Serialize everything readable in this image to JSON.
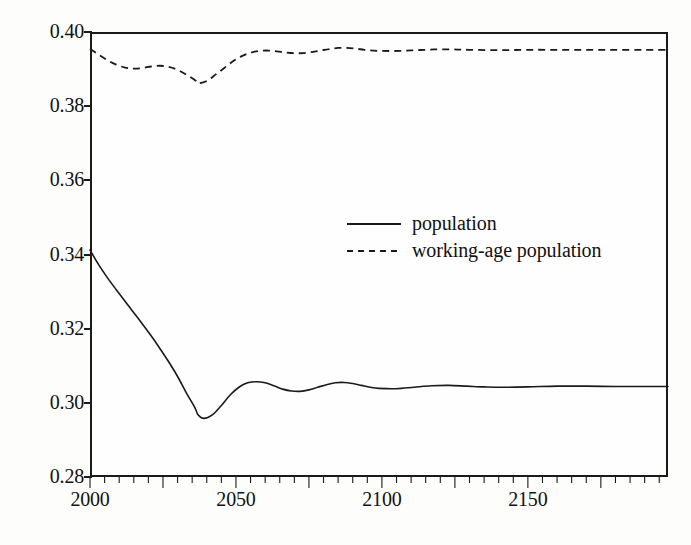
{
  "chart_data": {
    "type": "line",
    "title": "",
    "xlabel": "",
    "ylabel": "",
    "xlim": [
      2000,
      2198
    ],
    "ylim": [
      0.28,
      0.4
    ],
    "grid": false,
    "legend_position": "center",
    "x_ticks": [
      "2000",
      "2050",
      "2100",
      "2150"
    ],
    "x_tick_values": [
      2000,
      2050,
      2100,
      2150
    ],
    "y_ticks": [
      "0.28",
      "0.30",
      "0.32",
      "0.34",
      "0.36",
      "0.38",
      "0.40"
    ],
    "y_tick_values": [
      0.28,
      0.3,
      0.32,
      0.34,
      0.36,
      0.38,
      0.4
    ],
    "x_minor_tick_interval": 5,
    "series": [
      {
        "name": "population",
        "style": "solid",
        "color": "#1a1a1a",
        "x": [
          2000,
          2003,
          2006,
          2009,
          2012,
          2015,
          2018,
          2021,
          2024,
          2027,
          2030,
          2033,
          2036,
          2037,
          2039,
          2042,
          2045,
          2048,
          2051,
          2054,
          2057,
          2060,
          2063,
          2066,
          2069,
          2072,
          2075,
          2078,
          2081,
          2084,
          2087,
          2090,
          2093,
          2096,
          2099,
          2105,
          2111,
          2117,
          2123,
          2129,
          2135,
          2141,
          2150,
          2160,
          2170,
          2180,
          2190,
          2198
        ],
        "y": [
          0.3412,
          0.3372,
          0.3337,
          0.3305,
          0.3274,
          0.3243,
          0.3212,
          0.318,
          0.3146,
          0.311,
          0.3071,
          0.3027,
          0.2986,
          0.2968,
          0.2958,
          0.2968,
          0.2993,
          0.3021,
          0.3042,
          0.3054,
          0.3057,
          0.3054,
          0.3046,
          0.3037,
          0.3032,
          0.3031,
          0.3035,
          0.3042,
          0.3049,
          0.3054,
          0.3055,
          0.3052,
          0.3047,
          0.3042,
          0.3039,
          0.3038,
          0.3042,
          0.3046,
          0.3047,
          0.3045,
          0.3043,
          0.3042,
          0.3043,
          0.3045,
          0.3045,
          0.3044,
          0.3044,
          0.3044
        ]
      },
      {
        "name": "working-age population",
        "style": "dashed",
        "color": "#1a1a1a",
        "x": [
          2000,
          2003,
          2006,
          2009,
          2012,
          2015,
          2018,
          2021,
          2024,
          2027,
          2030,
          2033,
          2036,
          2037,
          2040,
          2043,
          2046,
          2049,
          2052,
          2055,
          2058,
          2061,
          2064,
          2067,
          2070,
          2073,
          2076,
          2079,
          2082,
          2085,
          2088,
          2091,
          2094,
          2097,
          2100,
          2106,
          2112,
          2118,
          2124,
          2130,
          2140,
          2150,
          2160,
          2170,
          2180,
          2190,
          2198
        ],
        "y": [
          0.3955,
          0.3939,
          0.3924,
          0.3912,
          0.3904,
          0.3901,
          0.3903,
          0.3907,
          0.3909,
          0.3906,
          0.3898,
          0.3885,
          0.387,
          0.3862,
          0.3868,
          0.3885,
          0.3903,
          0.3921,
          0.3935,
          0.3944,
          0.3949,
          0.395,
          0.3948,
          0.3945,
          0.3943,
          0.3943,
          0.3946,
          0.395,
          0.3954,
          0.3957,
          0.3957,
          0.3955,
          0.3952,
          0.395,
          0.3949,
          0.3949,
          0.3951,
          0.3953,
          0.3953,
          0.3952,
          0.3951,
          0.3952,
          0.3952,
          0.3952,
          0.3952,
          0.3952,
          0.3952
        ]
      }
    ]
  },
  "axes": {
    "y_labels": [
      "0.40",
      "0.38",
      "0.36",
      "0.34",
      "0.32",
      "0.30",
      "0.28"
    ],
    "x_labels": [
      "2000",
      "2050",
      "2100",
      "2150"
    ]
  },
  "legend": {
    "items": [
      {
        "label": "population",
        "style": "solid"
      },
      {
        "label": "working-age population",
        "style": "dashed"
      }
    ]
  }
}
